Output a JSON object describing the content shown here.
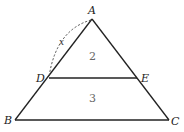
{
  "figure": {
    "type": "triangle-with-parallel-segment",
    "vertices": {
      "A": {
        "label": "A",
        "x": 92,
        "y": 19
      },
      "B": {
        "label": "B",
        "x": 15,
        "y": 120
      },
      "C": {
        "label": "C",
        "x": 169,
        "y": 120
      },
      "D": {
        "label": "D",
        "x": 49,
        "y": 78
      },
      "E": {
        "label": "E",
        "x": 137,
        "y": 78
      }
    },
    "segments": [
      "AB",
      "AC",
      "BC",
      "DE"
    ],
    "regions": [
      {
        "name": "triangle-ADE",
        "label": "2"
      },
      {
        "name": "trapezoid-DBCE",
        "label": "3"
      }
    ],
    "arc": {
      "from": "A",
      "to": "D",
      "style": "dashed",
      "label": "x"
    }
  }
}
